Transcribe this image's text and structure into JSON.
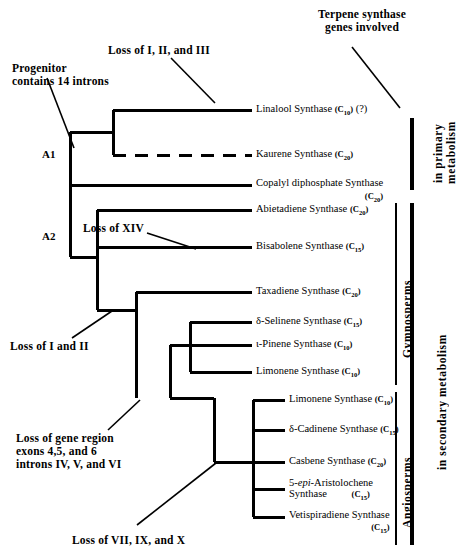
{
  "headers": {
    "right_header_line1": "Terpene synthase",
    "right_header_line2": "genes involved"
  },
  "annotations": [
    {
      "id": "progenitor",
      "line1": "Progenitor",
      "line2": "contains 14 introns"
    },
    {
      "id": "loss-i-ii-iii",
      "line1": "Loss of I, II, and III"
    },
    {
      "id": "loss-xiv",
      "line1": "Loss of XIV"
    },
    {
      "id": "loss-i-ii",
      "line1": "Loss of I and II"
    },
    {
      "id": "loss-gene-region",
      "line1": "Loss of gene region",
      "line2": "exons 4,5, and 6",
      "line3": "introns IV, V, and VI"
    },
    {
      "id": "loss-vii-ix-x",
      "line1": "Loss of VII, IX, and X"
    }
  ],
  "nodes": [
    {
      "id": "A1",
      "label": "A1"
    },
    {
      "id": "A2",
      "label": "A2"
    }
  ],
  "leaves": [
    {
      "id": "linalool",
      "name": "Linalool Synthase",
      "carbon": "C10",
      "suffix": "(?)",
      "wrap": false,
      "dashed": false
    },
    {
      "id": "kaurene",
      "name": "Kaurene Synthase",
      "carbon": "C20",
      "suffix": "",
      "wrap": false,
      "dashed": true
    },
    {
      "id": "copalyl",
      "name": "Copalyl diphosphate Synthase",
      "carbon": "C20",
      "suffix": "",
      "wrap": true,
      "dashed": false
    },
    {
      "id": "abietadiene",
      "name": "Abietadiene Synthase",
      "carbon": "C20",
      "suffix": "",
      "wrap": false,
      "dashed": false
    },
    {
      "id": "bisabolene",
      "name": "Bisabolene Synthase",
      "carbon": "C15",
      "suffix": "",
      "wrap": false,
      "dashed": false
    },
    {
      "id": "taxadiene",
      "name": "Taxadiene Synthase",
      "carbon": "C20",
      "suffix": "",
      "wrap": false,
      "dashed": false
    },
    {
      "id": "d-selinene",
      "name": "δ-Selinene Synthase",
      "carbon": "C15",
      "suffix": "",
      "wrap": false,
      "dashed": false
    },
    {
      "id": "a-pinene",
      "name": "ι-Pinene Synthase",
      "carbon": "C10",
      "suffix": "",
      "wrap": false,
      "dashed": false
    },
    {
      "id": "limonene-g",
      "name": "Limonene Synthase",
      "carbon": "C10",
      "suffix": "",
      "wrap": false,
      "dashed": false
    },
    {
      "id": "limonene-a",
      "name": "Limonene Synthase",
      "carbon": "C10",
      "suffix": "",
      "wrap": false,
      "dashed": false
    },
    {
      "id": "d-cadinene",
      "name": "δ-Cadinene Synthase",
      "carbon": "C15",
      "suffix": "",
      "wrap": false,
      "dashed": false
    },
    {
      "id": "casbene",
      "name": "Casbene Synthase",
      "carbon": "C20",
      "suffix": "",
      "wrap": false,
      "dashed": false
    },
    {
      "id": "aristolochene",
      "name": "5-epi-Aristolochene",
      "name2": "Synthase",
      "carbon": "C15",
      "suffix": "",
      "wrap": true,
      "italic_part": "epi",
      "dashed": false
    },
    {
      "id": "vetispiradiene",
      "name": "Vetispiradiene Synthase",
      "carbon": "C15",
      "suffix": "",
      "wrap": true,
      "dashed": false
    }
  ],
  "brackets": [
    {
      "id": "gymnosperms",
      "label": "Gymnosperms"
    },
    {
      "id": "angiosperms",
      "label": "Angiosperms"
    },
    {
      "id": "primary-metabolism",
      "label_line1": "in primary",
      "label_line2": "metabolism"
    },
    {
      "id": "secondary-metabolism",
      "label_line1": "in secondary metabolism"
    }
  ],
  "colors": {
    "line": "#000000",
    "background": "#ffffff"
  }
}
